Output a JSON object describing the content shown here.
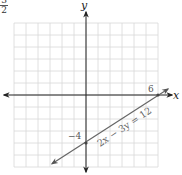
{
  "fragment": {
    "numerator": "3",
    "denominator": "2"
  },
  "chart_data": {
    "type": "line",
    "title": "",
    "xlabel": "x",
    "ylabel": "y",
    "equation": "2x − 3y = 12",
    "xlim": [
      -6,
      6
    ],
    "ylim": [
      -6,
      6
    ],
    "grid": true,
    "grid_step": 1,
    "annotations": [
      {
        "text": "6",
        "x": 6,
        "y": 0,
        "meaning": "x-intercept"
      },
      {
        "text": "−4",
        "x": 0,
        "y": -4,
        "meaning": "y-intercept"
      }
    ],
    "series": [
      {
        "name": "2x − 3y = 12",
        "points": [
          [
            -3,
            -6
          ],
          [
            0,
            -4
          ],
          [
            6,
            0
          ],
          [
            6.6,
            0.4
          ]
        ]
      }
    ],
    "colors": {
      "grid": "#d8d8d8",
      "axes": "#222222",
      "line": "#6a6a6a",
      "text": "#333333"
    }
  },
  "labels": {
    "x_axis": "x",
    "y_axis": "y",
    "x_intercept": "6",
    "y_intercept": "−4",
    "equation": "2x − 3y = 12"
  }
}
